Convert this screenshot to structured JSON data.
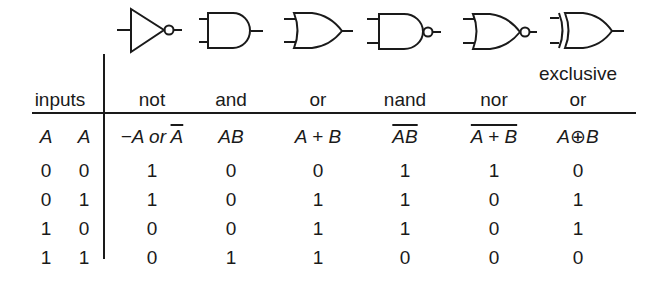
{
  "gates": [
    {
      "name": "not",
      "symbol": "not-gate"
    },
    {
      "name": "and",
      "symbol": "and-gate"
    },
    {
      "name": "or",
      "symbol": "or-gate"
    },
    {
      "name": "nand",
      "symbol": "nand-gate"
    },
    {
      "name": "nor",
      "symbol": "nor-gate"
    },
    {
      "name": "exclusive or",
      "symbol": "xor-gate"
    }
  ],
  "header": {
    "inputs_label": "inputs",
    "columns": [
      {
        "line1": "",
        "line2": "not"
      },
      {
        "line1": "",
        "line2": "and"
      },
      {
        "line1": "",
        "line2": "or"
      },
      {
        "line1": "",
        "line2": "nand"
      },
      {
        "line1": "",
        "line2": "nor"
      },
      {
        "line1": "exclusive",
        "line2": "or"
      }
    ]
  },
  "subheader": {
    "input1": "A",
    "input2": "A",
    "not_prefix": "−A or ",
    "not_bar": "A",
    "and": "AB",
    "or": "A + B",
    "nand_bar": "AB",
    "nor_bar": "A + B",
    "xor": "A⊕B"
  },
  "rows": [
    {
      "a": "0",
      "b": "0",
      "not": "1",
      "and": "0",
      "or": "0",
      "nand": "1",
      "nor": "1",
      "xor": "0"
    },
    {
      "a": "0",
      "b": "1",
      "not": "1",
      "and": "0",
      "or": "1",
      "nand": "1",
      "nor": "0",
      "xor": "1"
    },
    {
      "a": "1",
      "b": "0",
      "not": "0",
      "and": "0",
      "or": "1",
      "nand": "1",
      "nor": "0",
      "xor": "1"
    },
    {
      "a": "1",
      "b": "1",
      "not": "0",
      "and": "1",
      "or": "1",
      "nand": "0",
      "nor": "0",
      "xor": "0"
    }
  ]
}
